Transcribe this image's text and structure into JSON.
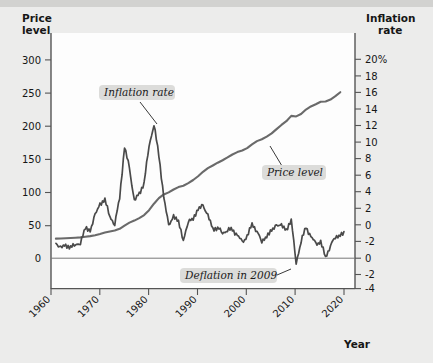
{
  "figure": {
    "background_color": "#ececeb",
    "plot_background_color": "#fdfdfd",
    "line_color": "#4a4a4a",
    "price_line_color": "#6a6a6a"
  },
  "axes": {
    "left": {
      "title_line1": "Price",
      "title_line2": "level",
      "ticks": [
        "300",
        "250",
        "200",
        "150",
        "100",
        "50",
        "0"
      ],
      "values": [
        300,
        250,
        200,
        150,
        100,
        50,
        0
      ],
      "min": 0,
      "max": 320
    },
    "right": {
      "title_line1": "Inflation",
      "title_line2": "rate",
      "ticks": [
        "20%",
        "18",
        "16",
        "14",
        "12",
        "10",
        "8",
        "6",
        "4",
        "2",
        "0",
        "-2",
        "-4"
      ],
      "values": [
        20,
        18,
        16,
        14,
        12,
        10,
        8,
        6,
        4,
        2,
        0,
        -2,
        -4
      ],
      "min": -4,
      "max": 20
    },
    "bottom": {
      "title": "Year",
      "ticks": [
        "1960",
        "1970",
        "1980",
        "1990",
        "2000",
        "2010",
        "2020"
      ],
      "values": [
        1960,
        1970,
        1980,
        1990,
        2000,
        2010,
        2020
      ],
      "min": 1959,
      "max": 2021
    }
  },
  "annotations": [
    {
      "id": "inflation-rate",
      "label": "Inflation rate"
    },
    {
      "id": "price-level",
      "label": "Price level"
    },
    {
      "id": "deflation-2009",
      "label": "Deflation in 2009"
    }
  ],
  "chart_data": {
    "type": "line",
    "title": "",
    "xlabel": "Year",
    "ylabel": "Price level",
    "y2label": "Inflation rate",
    "xlim": [
      1959,
      2021
    ],
    "ylim": [
      0,
      320
    ],
    "y2lim": [
      -4,
      20
    ],
    "grid": false,
    "legend_position": "inline-annotations",
    "x": [
      1960,
      1961,
      1962,
      1963,
      1964,
      1965,
      1966,
      1967,
      1968,
      1969,
      1970,
      1971,
      1972,
      1973,
      1974,
      1975,
      1976,
      1977,
      1978,
      1979,
      1980,
      1981,
      1982,
      1983,
      1984,
      1985,
      1986,
      1987,
      1988,
      1989,
      1990,
      1991,
      1992,
      1993,
      1994,
      1995,
      1996,
      1997,
      1998,
      1999,
      2000,
      2001,
      2002,
      2003,
      2004,
      2005,
      2006,
      2007,
      2008,
      2009,
      2010,
      2011,
      2012,
      2013,
      2014,
      2015,
      2016,
      2017,
      2018
    ],
    "series": [
      {
        "name": "Price level",
        "axis": "left",
        "units": "index (1982-84 = 100)",
        "values": [
          29.6,
          29.9,
          30.2,
          30.6,
          31.0,
          31.5,
          32.4,
          33.4,
          34.8,
          36.7,
          38.8,
          40.5,
          41.8,
          44.4,
          49.3,
          53.8,
          56.9,
          60.6,
          65.2,
          72.6,
          82.4,
          90.9,
          96.5,
          99.6,
          103.9,
          107.6,
          109.6,
          113.6,
          118.3,
          124.0,
          130.7,
          136.2,
          140.3,
          144.5,
          148.2,
          152.4,
          156.9,
          160.5,
          163.0,
          166.6,
          172.2,
          177.1,
          179.9,
          184.0,
          188.9,
          195.3,
          201.6,
          207.3,
          215.3,
          214.5,
          218.1,
          224.9,
          229.6,
          233.0,
          236.7,
          237.0,
          240.0,
          245.1,
          251.1
        ]
      },
      {
        "name": "Inflation rate",
        "axis": "right",
        "units": "percent",
        "values": [
          1.5,
          1.1,
          1.2,
          1.2,
          1.3,
          1.6,
          3.0,
          2.8,
          4.3,
          5.5,
          5.8,
          4.3,
          3.3,
          6.2,
          11.1,
          9.1,
          5.7,
          6.5,
          7.6,
          11.3,
          13.5,
          10.3,
          6.2,
          3.2,
          4.3,
          3.6,
          1.9,
          3.6,
          4.1,
          4.8,
          5.4,
          4.2,
          3.0,
          3.0,
          2.6,
          2.8,
          2.9,
          2.3,
          1.6,
          2.2,
          3.4,
          2.8,
          1.6,
          2.3,
          2.7,
          3.4,
          3.2,
          2.9,
          3.8,
          -0.4,
          1.6,
          3.2,
          2.1,
          1.5,
          1.6,
          0.1,
          1.3,
          2.1,
          2.4
        ]
      }
    ],
    "notes": [
      "Inflation rate peaks near 13.5% in 1980 and 11.3% in 1979/1974.",
      "Deflation of about -0.4% occurs in 2009.",
      "Price level rises steadily from about 30 in 1960 to about 250 by 2018."
    ]
  }
}
